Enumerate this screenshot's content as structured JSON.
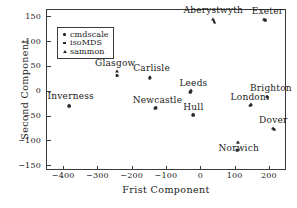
{
  "chart_data": {
    "type": "scatter",
    "title": "",
    "xlabel": "Frist Component",
    "ylabel": "Second Component",
    "xlim": [
      -450,
      250
    ],
    "ylim": [
      -160,
      165
    ],
    "xticks": [
      -400,
      -300,
      -200,
      -100,
      0,
      100,
      200
    ],
    "xticklabels": [
      "−400",
      "−300",
      "−200",
      "−100",
      "0",
      "100",
      "200"
    ],
    "yticks": [
      -150,
      -100,
      -50,
      0,
      50,
      100,
      150
    ],
    "yticklabels": [
      "−150",
      "−100",
      "−50",
      "0",
      "50",
      "100",
      "150"
    ],
    "grid": false,
    "legend_position": "upper left",
    "series": [
      {
        "name": "cmdscale",
        "marker": "circle",
        "color": "#262626",
        "points": [
          {
            "label": "Inverness",
            "x": -382,
            "y": -30
          },
          {
            "label": "Glasgow",
            "x": -243,
            "y": 31
          },
          {
            "label": "Carlisle",
            "x": -148,
            "y": 27
          },
          {
            "label": "Newcastle",
            "x": -130,
            "y": -34
          },
          {
            "label": "Leeds",
            "x": -28,
            "y": -1
          },
          {
            "label": "Hull",
            "x": -20,
            "y": -48
          },
          {
            "label": "Aberystwyth",
            "x": 40,
            "y": 140
          },
          {
            "label": "Norwich",
            "x": 110,
            "y": -105
          },
          {
            "label": "London",
            "x": 148,
            "y": -28
          },
          {
            "label": "Brighton",
            "x": 196,
            "y": -12
          },
          {
            "label": "Exeter",
            "x": 188,
            "y": 143
          },
          {
            "label": "Dover",
            "x": 214,
            "y": -77
          }
        ]
      },
      {
        "name": "isoMDS",
        "marker": "square",
        "color": "#262626",
        "points": [
          {
            "label": "Inverness",
            "x": -383,
            "y": -31
          },
          {
            "label": "Glasgow",
            "x": -242,
            "y": 30
          },
          {
            "label": "Carlisle",
            "x": -147,
            "y": 25
          },
          {
            "label": "Newcastle",
            "x": -131,
            "y": -35
          },
          {
            "label": "Leeds",
            "x": -29,
            "y": -3
          },
          {
            "label": "Hull",
            "x": -21,
            "y": -49
          },
          {
            "label": "Aberystwyth",
            "x": 42,
            "y": 137
          },
          {
            "label": "Norwich",
            "x": 108,
            "y": -120
          },
          {
            "label": "London",
            "x": 146,
            "y": -30
          },
          {
            "label": "Brighton",
            "x": 197,
            "y": -15
          },
          {
            "label": "Exeter",
            "x": 190,
            "y": 142
          },
          {
            "label": "Dover",
            "x": 215,
            "y": -79
          }
        ]
      },
      {
        "name": "sammon",
        "marker": "triangle",
        "color": "#262626",
        "points": [
          {
            "label": "Inverness",
            "x": -384,
            "y": -29
          },
          {
            "label": "Glasgow",
            "x": -243,
            "y": 40
          },
          {
            "label": "Carlisle",
            "x": -148,
            "y": 28
          },
          {
            "label": "Newcastle",
            "x": -130,
            "y": -33
          },
          {
            "label": "Leeds",
            "x": -27,
            "y": 2
          },
          {
            "label": "Hull",
            "x": -20,
            "y": -47
          },
          {
            "label": "Aberystwyth",
            "x": 38,
            "y": 145
          },
          {
            "label": "Norwich",
            "x": 110,
            "y": -104
          },
          {
            "label": "London",
            "x": 147,
            "y": -27
          },
          {
            "label": "Brighton",
            "x": 196,
            "y": -10
          },
          {
            "label": "Exeter",
            "x": 187,
            "y": 144
          },
          {
            "label": "Dover",
            "x": 213,
            "y": -76
          }
        ]
      }
    ],
    "annotations": [
      {
        "text": "Aberystwyth",
        "x": 38,
        "y": 163,
        "anchor": "center"
      },
      {
        "text": "Exeter",
        "x": 196,
        "y": 160,
        "anchor": "center"
      },
      {
        "text": "Glasgow",
        "x": -248,
        "y": 57,
        "anchor": "center"
      },
      {
        "text": "Carlisle",
        "x": -142,
        "y": 46,
        "anchor": "center"
      },
      {
        "text": "Leeds",
        "x": -20,
        "y": 16,
        "anchor": "center"
      },
      {
        "text": "Brighton",
        "x": 206,
        "y": 5,
        "anchor": "center"
      },
      {
        "text": "London",
        "x": 140,
        "y": -12,
        "anchor": "center"
      },
      {
        "text": "Inverness",
        "x": -378,
        "y": -11,
        "anchor": "center"
      },
      {
        "text": "Newcastle",
        "x": -125,
        "y": -18,
        "anchor": "center"
      },
      {
        "text": "Hull",
        "x": -20,
        "y": -32,
        "anchor": "center"
      },
      {
        "text": "Dover",
        "x": 213,
        "y": -60,
        "anchor": "center"
      },
      {
        "text": "Norwich",
        "x": 112,
        "y": -115,
        "anchor": "center"
      }
    ]
  },
  "legend": {
    "entries": [
      {
        "label": "cmdscale",
        "marker": "circle"
      },
      {
        "label": "isoMDS",
        "marker": "square"
      },
      {
        "label": "sammon",
        "marker": "triangle"
      }
    ]
  }
}
